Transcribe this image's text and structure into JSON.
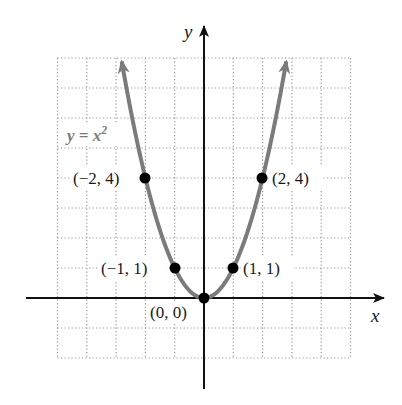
{
  "chart_data": {
    "type": "line",
    "title": "",
    "function": "y = x^2",
    "xlabel": "x",
    "ylabel": "y",
    "xlim": [
      -5,
      5
    ],
    "ylim": [
      -2,
      8
    ],
    "grid": true,
    "grid_style": "dotted",
    "grid_step": 1,
    "series": [
      {
        "name": "y = x²",
        "x": [
          -2.83,
          -2,
          -1,
          0,
          1,
          2,
          2.83
        ],
        "y": [
          8,
          4,
          1,
          0,
          1,
          4,
          8
        ],
        "arrows_at_ends": true
      }
    ],
    "labeled_points": [
      {
        "x": -2,
        "y": 4,
        "label": "(−2, 4)"
      },
      {
        "x": -1,
        "y": 1,
        "label": "(−1, 1)"
      },
      {
        "x": 0,
        "y": 0,
        "label": "(0, 0)"
      },
      {
        "x": 1,
        "y": 1,
        "label": "(1, 1)"
      },
      {
        "x": 2,
        "y": 4,
        "label": "(2, 4)"
      }
    ],
    "annotations": [
      {
        "text": "y = x²",
        "near": [
          -4.5,
          5.5
        ]
      }
    ]
  },
  "labels": {
    "x_axis": "x",
    "y_axis": "y",
    "equation": "y = x",
    "equation_exp": "2",
    "p_m2_4": "(−2, 4)",
    "p_m1_1": "(−1, 1)",
    "p_0_0": "(0, 0)",
    "p_1_1": "(1, 1)",
    "p_2_4": "(2, 4)"
  },
  "colors": {
    "curve": "#7b7b7b",
    "axes": "#111111",
    "grid": "#9a9a9a",
    "points": "#000000"
  }
}
